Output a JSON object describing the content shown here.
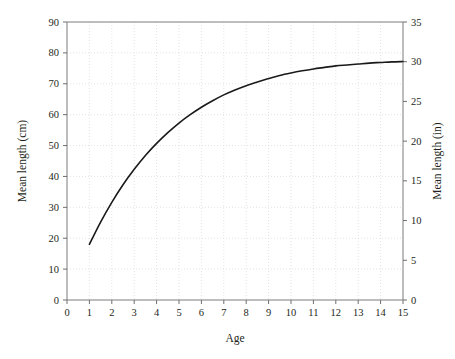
{
  "chart_data": {
    "type": "line",
    "title": "",
    "subtitle": "",
    "xlabel": "Age",
    "ylabel": "Mean length (cm)",
    "y2label": "Mean length (in)",
    "xlim": [
      0,
      15
    ],
    "ylim": [
      0,
      90
    ],
    "y2lim": [
      0,
      35
    ],
    "grid": true,
    "legend": null,
    "legend_position": "none",
    "xticks": [
      0,
      1,
      2,
      3,
      4,
      5,
      6,
      7,
      8,
      9,
      10,
      11,
      12,
      13,
      14,
      15
    ],
    "xtick_labels": [
      "0",
      "1",
      "2",
      "3",
      "4",
      "5",
      "6",
      "7",
      "8",
      "9",
      "10",
      "11",
      "12",
      "13",
      "14",
      "15"
    ],
    "yticks": [
      0,
      10,
      20,
      30,
      40,
      50,
      60,
      70,
      80,
      90
    ],
    "ytick_labels": [
      "0",
      "10",
      "20",
      "30",
      "40",
      "50",
      "60",
      "70",
      "80",
      "90"
    ],
    "y2ticks": [
      0,
      5,
      10,
      15,
      20,
      25,
      30,
      35
    ],
    "y2tick_labels": [
      "0",
      "5",
      "10",
      "15",
      "20",
      "25",
      "30",
      "35"
    ],
    "series": [
      {
        "name": "Mean length",
        "color": "#1a1a1a",
        "x": [
          1,
          1.5,
          2,
          2.5,
          3,
          3.5,
          4,
          4.5,
          5,
          5.5,
          6,
          6.5,
          7,
          7.5,
          8,
          8.5,
          9,
          9.5,
          10,
          10.5,
          11,
          11.5,
          12,
          12.5,
          13,
          13.5,
          14,
          14.5,
          15
        ],
        "values": [
          18.0,
          25.2,
          31.6,
          37.3,
          42.3,
          46.8,
          50.7,
          54.2,
          57.3,
          60.0,
          62.4,
          64.5,
          66.4,
          68.0,
          69.4,
          70.6,
          71.7,
          72.7,
          73.5,
          74.2,
          74.8,
          75.3,
          75.8,
          76.1,
          76.4,
          76.7,
          76.9,
          77.1,
          77.2
        ]
      }
    ],
    "annotations": []
  },
  "axis": {
    "y_left_title": "Mean length (cm)",
    "y_right_title": "Mean length (in)",
    "x_title": "Age"
  },
  "colors": {
    "curve": "#1a1a1a",
    "grid": "#d8d8d8",
    "frame": "#7d7d7d",
    "text": "#231f20",
    "background": "#ffffff"
  }
}
